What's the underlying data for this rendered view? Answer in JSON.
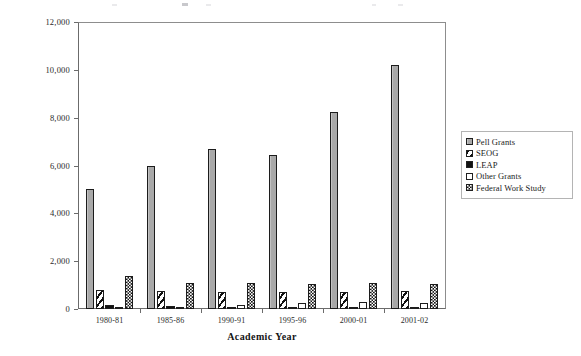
{
  "axes": {
    "x_title": "Academic Year",
    "y_tick_labels": [
      "12,000",
      "10,000",
      "8,000",
      "6,000",
      "4,000",
      "2,000",
      "0"
    ],
    "x_tick_labels": [
      "1980-81",
      "1985-86",
      "1990-91",
      "1995-96",
      "2000-01",
      "2001-02"
    ]
  },
  "legend": {
    "items": [
      {
        "label": "Pell Grants",
        "swatch": "solid-gray-swatch",
        "color": "#a9a9a9"
      },
      {
        "label": "SEOG",
        "swatch": "diagonal-hatch-swatch",
        "color": "#111111"
      },
      {
        "label": "LEAP",
        "swatch": "solid-black-swatch",
        "color": "#111111"
      },
      {
        "label": "Other Grants",
        "swatch": "empty-white-swatch",
        "color": "#ffffff"
      },
      {
        "label": "Federal Work Study",
        "swatch": "checkerboard-swatch",
        "color": "#141414"
      }
    ]
  },
  "chart_data": {
    "type": "bar",
    "title": "",
    "xlabel": "Academic Year",
    "ylabel": "",
    "ylim": [
      0,
      12000
    ],
    "ytick_step": 2000,
    "grid": false,
    "legend_position": "right",
    "categories": [
      "1980-81",
      "1985-86",
      "1990-91",
      "1995-96",
      "2000-01",
      "2001-02"
    ],
    "series": [
      {
        "name": "Pell Grants",
        "values": [
          5000,
          6000,
          6700,
          6450,
          8250,
          10200
        ]
      },
      {
        "name": "SEOG",
        "values": [
          800,
          750,
          700,
          700,
          700,
          760
        ]
      },
      {
        "name": "LEAP",
        "values": [
          150,
          110,
          90,
          80,
          80,
          80
        ]
      },
      {
        "name": "Other Grants",
        "values": [
          40,
          50,
          170,
          250,
          300,
          250
        ]
      },
      {
        "name": "Federal Work Study",
        "values": [
          1400,
          1100,
          1100,
          1050,
          1100,
          1050
        ]
      }
    ]
  }
}
